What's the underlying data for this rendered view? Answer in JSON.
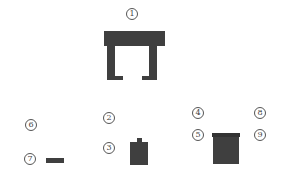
{
  "diagram": {
    "labels": [
      {
        "id": "label-1",
        "text": "1",
        "cx": 132,
        "cy": 14
      },
      {
        "id": "label-2",
        "text": "2",
        "cx": 109,
        "cy": 118
      },
      {
        "id": "label-3",
        "text": "3",
        "cx": 109,
        "cy": 148
      },
      {
        "id": "label-4",
        "text": "4",
        "cx": 198,
        "cy": 113
      },
      {
        "id": "label-5",
        "text": "5",
        "cx": 198,
        "cy": 135
      },
      {
        "id": "label-6",
        "text": "6",
        "cx": 31,
        "cy": 125
      },
      {
        "id": "label-7",
        "text": "7",
        "cx": 30,
        "cy": 159
      },
      {
        "id": "label-8",
        "text": "8",
        "cx": 260,
        "cy": 113
      },
      {
        "id": "label-9",
        "text": "9",
        "cx": 260,
        "cy": 135
      }
    ],
    "colors": {
      "part_fill": "#3f3f3f",
      "part_dark": "#333333",
      "label_stroke": "#555555",
      "background": "#ffffff"
    }
  }
}
